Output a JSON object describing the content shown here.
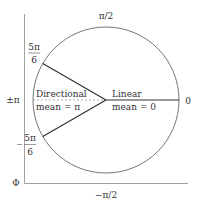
{
  "diagram": {
    "colors": {
      "circle": "#666666",
      "spoke": "#333333",
      "axis": "#777777",
      "dashed": "#999999",
      "text": "#333333"
    },
    "angle_labels": {
      "top": "π/2",
      "bottom": "−π/2",
      "right": "0",
      "left": "±π",
      "upper_left_num": "5π",
      "upper_left_den": "6",
      "lower_left_num": "5π",
      "lower_left_den": "6"
    },
    "axis_label": "Φ",
    "directional": {
      "line1": "Directional",
      "line2": "mean = π"
    },
    "linear": {
      "line1": "Linear",
      "line2": "mean = 0"
    },
    "geometry": {
      "center": [
        106,
        100
      ],
      "radius": 73,
      "spoke_angles_deg": [
        0,
        150,
        -150
      ]
    }
  }
}
